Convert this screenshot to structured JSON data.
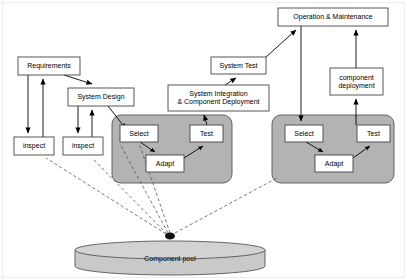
{
  "figure": {
    "background_color": "#ffffff",
    "line_color": "#000000",
    "box_fill": "#ffffff",
    "group_fill": "#b3b3b3",
    "pool_fill": "#c8c8c8",
    "frame_color": "#e8e8e8"
  },
  "nodes": {
    "requirements": {
      "label": "Requirements",
      "x": 18,
      "y": 57,
      "w": 62,
      "h": 18,
      "font_size": 7.0
    },
    "system_design": {
      "label": "System Design",
      "x": 68,
      "y": 88,
      "w": 66,
      "h": 18,
      "font_size": 7.0
    },
    "inspect_left": {
      "label": "inspect",
      "x": 14,
      "y": 137,
      "w": 40,
      "h": 18,
      "font_size": 7.0
    },
    "inspect_right": {
      "label": "inspect",
      "x": 63,
      "y": 137,
      "w": 40,
      "h": 18,
      "font_size": 7.0
    },
    "sys_integration": {
      "label": "System Integration\n& Component Deployment",
      "x": 168,
      "y": 85,
      "w": 101,
      "h": 26,
      "font_size": 7.0
    },
    "system_test": {
      "label": "System Test",
      "x": 211,
      "y": 57,
      "w": 55,
      "h": 17,
      "font_size": 7.0
    },
    "operation_maintenance": {
      "label": "Operation & Maintenance",
      "x": 278,
      "y": 8,
      "w": 110,
      "h": 18,
      "font_size": 7.0
    },
    "component_deployment": {
      "label": "component\ndeployment",
      "x": 330,
      "y": 68,
      "w": 53,
      "h": 27,
      "font_size": 7.0
    },
    "select_left": {
      "label": "Select",
      "x": 120,
      "y": 125,
      "w": 38,
      "h": 17,
      "font_size": 7.0
    },
    "adapt_left": {
      "label": "Adapt",
      "x": 146,
      "y": 155,
      "w": 38,
      "h": 17,
      "font_size": 7.0
    },
    "test_left": {
      "label": "Test",
      "x": 190,
      "y": 125,
      "w": 33,
      "h": 17,
      "font_size": 7.0
    },
    "select_right": {
      "label": "Select",
      "x": 285,
      "y": 125,
      "w": 38,
      "h": 17,
      "font_size": 7.0
    },
    "adapt_right": {
      "label": "Adapt",
      "x": 315,
      "y": 155,
      "w": 38,
      "h": 17,
      "font_size": 7.0
    },
    "test_right": {
      "label": "Test",
      "x": 357,
      "y": 125,
      "w": 33,
      "h": 17,
      "font_size": 7.0
    },
    "component_pool": {
      "label": "Component pool",
      "x": 75,
      "y": 237,
      "w": 190,
      "h": 30,
      "font_size": 7.0
    }
  },
  "groups": {
    "group_left": {
      "x": 112,
      "y": 115,
      "w": 120,
      "h": 68,
      "radius": 9
    },
    "group_right": {
      "x": 272,
      "y": 115,
      "w": 122,
      "h": 68,
      "radius": 9
    }
  },
  "pool": {
    "cx": 170,
    "cy": 250,
    "rx": 95,
    "ry": 9,
    "depth": 16
  },
  "edges": [
    {
      "name": "requirements-to-inspect-left",
      "from": "requirements",
      "to": "inspect_left",
      "style": "solid",
      "direction": "down"
    },
    {
      "name": "inspect-left-to-requirements",
      "from": "inspect_left",
      "to": "requirements",
      "style": "solid",
      "direction": "up"
    },
    {
      "name": "requirements-to-system-design",
      "from": "requirements",
      "to": "system_design",
      "style": "solid",
      "direction": "down-right"
    },
    {
      "name": "system-design-to-inspect-right",
      "from": "system_design",
      "to": "inspect_right",
      "style": "solid",
      "direction": "down"
    },
    {
      "name": "inspect-right-to-system-design",
      "from": "inspect_right",
      "to": "system_design",
      "style": "solid",
      "direction": "up"
    },
    {
      "name": "system-design-to-select-left",
      "from": "system_design",
      "to": "select_left",
      "style": "solid",
      "direction": "down-right"
    },
    {
      "name": "select-left-to-adapt-left",
      "from": "select_left",
      "to": "adapt_left",
      "style": "solid",
      "direction": "down-right"
    },
    {
      "name": "adapt-left-to-test-left",
      "from": "adapt_left",
      "to": "test_left",
      "style": "solid",
      "direction": "up-right"
    },
    {
      "name": "test-left-to-system-integration",
      "from": "test_left",
      "to": "sys_integration",
      "style": "solid",
      "direction": "up"
    },
    {
      "name": "system-integration-to-system-test",
      "from": "sys_integration",
      "to": "system_test",
      "style": "solid",
      "direction": "up"
    },
    {
      "name": "system-test-to-operation-maintenance",
      "from": "system_test",
      "to": "operation_maintenance",
      "style": "solid",
      "direction": "up-right"
    },
    {
      "name": "operation-maintenance-to-select-right",
      "from": "operation_maintenance",
      "to": "select_right",
      "style": "solid",
      "direction": "down"
    },
    {
      "name": "select-right-to-adapt-right",
      "from": "select_right",
      "to": "adapt_right",
      "style": "solid",
      "direction": "down-right"
    },
    {
      "name": "adapt-right-to-test-right",
      "from": "adapt_right",
      "to": "test_right",
      "style": "solid",
      "direction": "up-right"
    },
    {
      "name": "test-right-to-component-deployment",
      "from": "test_right",
      "to": "component_deployment",
      "style": "solid",
      "direction": "up"
    },
    {
      "name": "component-deployment-to-operation-maintenance",
      "from": "component_deployment",
      "to": "operation_maintenance",
      "style": "solid",
      "direction": "up"
    },
    {
      "name": "pool-to-inspect-left",
      "from": "component_pool",
      "to": "inspect_left",
      "style": "dashed",
      "direction": "up-left"
    },
    {
      "name": "pool-to-inspect-right",
      "from": "component_pool",
      "to": "inspect_right",
      "style": "dashed",
      "direction": "up-left"
    },
    {
      "name": "pool-to-system-design",
      "from": "component_pool",
      "to": "system_design",
      "style": "dashed",
      "direction": "up-left"
    },
    {
      "name": "pool-to-select-left",
      "from": "component_pool",
      "to": "select_left",
      "style": "dashed",
      "direction": "up"
    },
    {
      "name": "pool-to-group-right",
      "from": "component_pool",
      "to": "group_right",
      "style": "dashed",
      "direction": "up-right"
    }
  ]
}
